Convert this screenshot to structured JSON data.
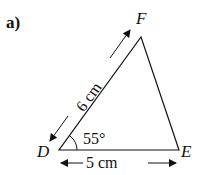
{
  "part_label": "a)",
  "vertices": {
    "D": {
      "label": "D",
      "x": 59,
      "y": 150
    },
    "E": {
      "label": "E",
      "x": 179,
      "y": 150
    },
    "F": {
      "label": "F",
      "x": 141,
      "y": 37
    }
  },
  "side_DF": {
    "label": "6 cm"
  },
  "side_DE": {
    "label": "5 cm"
  },
  "angle_D": {
    "label": "55°"
  },
  "colors": {
    "stroke": "#111111",
    "background": "#ffffff"
  }
}
